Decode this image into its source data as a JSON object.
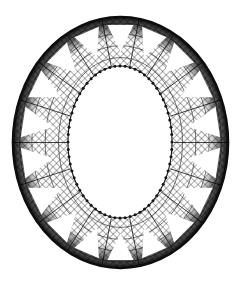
{
  "figure": {
    "title": "Oval openwork lace mesh ring",
    "background_color": "#ffffff",
    "ink_color": "#101010",
    "canvas": {
      "width": 241,
      "height": 282
    }
  },
  "chart_data": {
    "type": "scatter",
    "title": "Oval openwork lace mesh ring",
    "xlabel": "",
    "ylabel": "",
    "xlim": [
      0,
      241
    ],
    "ylim": [
      0,
      282
    ],
    "grid": false,
    "legend": "none",
    "outer_ellipse": {
      "center_x": 120.5,
      "center_y": 142.5,
      "radius_x": 107.5,
      "radius_y": 125.5,
      "left": 13,
      "right": 228,
      "top": 17,
      "bottom": 268
    },
    "inner_oval": {
      "center_x": 120.0,
      "center_y": 142.0,
      "radius_x": 52.0,
      "radius_y": 76.0,
      "left": 68,
      "right": 172,
      "top": 66,
      "bottom": 218,
      "fill": "#ffffff"
    },
    "wedges": {
      "count": 18,
      "shape": "triangle",
      "fill": "#ffffff",
      "apex_radius_fraction": 0.3,
      "base_radius_fraction": 0.86,
      "half_angle_degrees": 7.5
    },
    "mesh": {
      "pattern": "diagonal-crosshatch",
      "cell_size_px": 5,
      "line_width_px": 0.7,
      "stroke": "#1a1a1a"
    },
    "rim": {
      "outer_band_width_px": 7,
      "outer_band_color": "#0d0d0d",
      "inner_bead_count": 64,
      "inner_bead_radius_px": 1.5,
      "inner_bead_color": "#161616"
    },
    "radial_struts": {
      "count": 18,
      "stroke": "#141414"
    }
  }
}
